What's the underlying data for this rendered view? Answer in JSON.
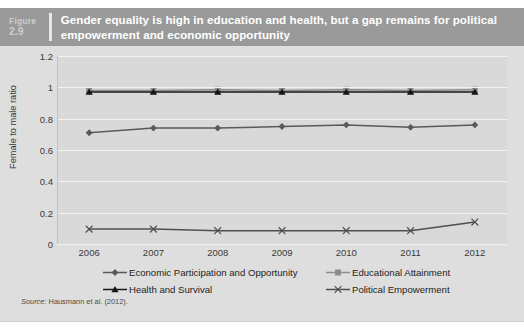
{
  "figure": {
    "label_word": "Figure",
    "number": "2.9",
    "title": "Gender equality is high in education and health, but a gap remains for political empowerment and economic opportunity"
  },
  "source": {
    "label": "Source:",
    "text": " Hausmann et al. (2012)."
  },
  "colors": {
    "title_bar": "#9a9a9a",
    "panel_bg": "#dedede",
    "plot_bg": "#d9d9d9",
    "gridline": "#f2f2f2",
    "economic": "#595959",
    "education": "#8c8c8c",
    "health": "#151515",
    "political": "#4f4f4f"
  },
  "chart_data": {
    "type": "line",
    "title": "Gender equality is high in education and health, but a gap remains for political empowerment and economic opportunity",
    "xlabel": "",
    "ylabel": "Female to male ratio",
    "categories": [
      "2006",
      "2007",
      "2008",
      "2009",
      "2010",
      "2011",
      "2012"
    ],
    "x": [
      2006,
      2007,
      2008,
      2009,
      2010,
      2011,
      2012
    ],
    "ylim": [
      0,
      1.2
    ],
    "yticks": [
      "0",
      "0.2",
      "0.4",
      "0.6",
      "0.8",
      "1",
      "1.2"
    ],
    "ytick_values": [
      0,
      0.2,
      0.4,
      0.6,
      0.8,
      1,
      1.2
    ],
    "grid": true,
    "legend_position": "bottom",
    "series": [
      {
        "name": "Economic Participation and Opportunity",
        "marker": "diamond",
        "color": "#595959",
        "values": [
          0.71,
          0.74,
          0.74,
          0.75,
          0.76,
          0.745,
          0.76
        ]
      },
      {
        "name": "Educational Attainment",
        "marker": "square",
        "color": "#8c8c8c",
        "values": [
          0.98,
          0.98,
          0.985,
          0.98,
          0.985,
          0.98,
          0.985
        ]
      },
      {
        "name": "Health and Survival",
        "marker": "triangle",
        "color": "#151515",
        "values": [
          0.97,
          0.97,
          0.97,
          0.97,
          0.97,
          0.97,
          0.97
        ]
      },
      {
        "name": "Political Empowerment",
        "marker": "x",
        "color": "#4f4f4f",
        "values": [
          0.095,
          0.095,
          0.085,
          0.085,
          0.085,
          0.085,
          0.14
        ]
      }
    ]
  }
}
